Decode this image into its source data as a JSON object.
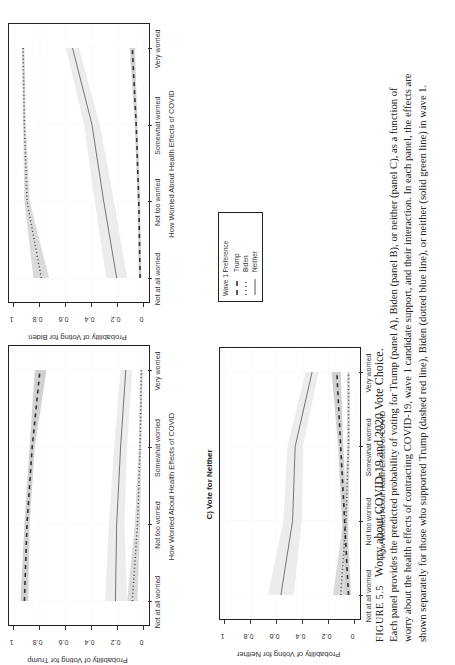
{
  "figure": {
    "label": "FIGURE 5.5",
    "title": "Worry about COVID-19 and 2020 Vote Choice.",
    "caption_lines": [
      "Each panel provides the predicted probability of voting for Trump (panel A), Biden (panel B), or neither (panel C), as a function of",
      "worry about the health effects of contracting COVID-19, wave 1 candidate support, and their interaction. In each panel, the effects are",
      "shown separately for those who supported Trump (dashed red line), Biden (dotted blue line), or neither (solid green line) in wave 1."
    ]
  },
  "legend": {
    "title": "Wave 1 Preference",
    "items": [
      {
        "label": "Trump",
        "style": "dashed"
      },
      {
        "label": "Biden",
        "style": "dotted"
      },
      {
        "label": "Neither",
        "style": "solid"
      }
    ]
  },
  "axes": {
    "xlabel": "How Worried About Health Effects of COVID",
    "categories": [
      "Not at all worried",
      "Not too worried",
      "Somewhat worried",
      "Very worried"
    ],
    "yticks": [
      "0",
      "0.2",
      "0.4",
      "0.6",
      "0.8",
      "1"
    ]
  },
  "panels": {
    "A": {
      "title": "",
      "ylabel": "Probability of Voting for Trump"
    },
    "B": {
      "title": "",
      "ylabel": "Probability of Voting for Biden"
    },
    "C": {
      "title": "C) Vote for Neither",
      "ylabel": "Probability of Voting for Neither"
    }
  },
  "chart_data": [
    {
      "type": "line",
      "title": "A) Vote for Trump",
      "xlabel": "How Worried About Health Effects of COVID",
      "ylabel": "Probability of Voting for Trump",
      "ylim": [
        0,
        1
      ],
      "categories": [
        "Not at all worried",
        "Not too worried",
        "Somewhat worried",
        "Very worried"
      ],
      "series": [
        {
          "name": "Trump",
          "style": "dashed",
          "values": [
            0.92,
            0.9,
            0.86,
            0.8
          ],
          "ci_lower": [
            0.89,
            0.88,
            0.84,
            0.75
          ],
          "ci_upper": [
            0.95,
            0.92,
            0.88,
            0.84
          ]
        },
        {
          "name": "Biden",
          "style": "dotted",
          "values": [
            0.09,
            0.05,
            0.03,
            0.02
          ],
          "ci_lower": [
            0.05,
            0.03,
            0.02,
            0.01
          ],
          "ci_upper": [
            0.13,
            0.07,
            0.04,
            0.03
          ]
        },
        {
          "name": "Neither",
          "style": "solid",
          "values": [
            0.22,
            0.21,
            0.18,
            0.14
          ],
          "ci_lower": [
            0.13,
            0.15,
            0.13,
            0.09
          ],
          "ci_upper": [
            0.3,
            0.27,
            0.23,
            0.18
          ]
        }
      ],
      "grid": true,
      "legend_position": "shared-box"
    },
    {
      "type": "line",
      "title": "B) Vote for Biden",
      "xlabel": "How Worried About Health Effects of COVID",
      "ylabel": "Probability of Voting for Biden",
      "ylim": [
        0,
        1
      ],
      "categories": [
        "Not at all worried",
        "Not too worried",
        "Somewhat worried",
        "Very worried"
      ],
      "series": [
        {
          "name": "Trump",
          "style": "dashed",
          "values": [
            0.03,
            0.04,
            0.06,
            0.09
          ],
          "ci_lower": [
            0.02,
            0.03,
            0.05,
            0.07
          ],
          "ci_upper": [
            0.04,
            0.05,
            0.07,
            0.11
          ]
        },
        {
          "name": "Biden",
          "style": "dotted",
          "values": [
            0.79,
            0.9,
            0.92,
            0.93
          ],
          "ci_lower": [
            0.73,
            0.88,
            0.91,
            0.92
          ],
          "ci_upper": [
            0.85,
            0.92,
            0.93,
            0.94
          ]
        },
        {
          "name": "Neither",
          "style": "solid",
          "values": [
            0.21,
            0.31,
            0.4,
            0.55
          ],
          "ci_lower": [
            0.13,
            0.23,
            0.34,
            0.5
          ],
          "ci_upper": [
            0.29,
            0.38,
            0.46,
            0.6
          ]
        }
      ],
      "grid": true,
      "legend_position": "shared-box"
    },
    {
      "type": "line",
      "title": "C) Vote for Neither",
      "xlabel": "How Worried About Health Effects of COVID",
      "ylabel": "Probability of Voting for Neither",
      "ylim": [
        0,
        1
      ],
      "categories": [
        "Not at all worried",
        "Not too worried",
        "Somewhat worried",
        "Very worried"
      ],
      "series": [
        {
          "name": "Trump",
          "style": "dashed",
          "values": [
            0.05,
            0.08,
            0.11,
            0.14
          ],
          "ci_lower": [
            0.03,
            0.06,
            0.09,
            0.11
          ],
          "ci_upper": [
            0.07,
            0.1,
            0.13,
            0.18
          ]
        },
        {
          "name": "Biden",
          "style": "dotted",
          "values": [
            0.11,
            0.07,
            0.05,
            0.05
          ],
          "ci_lower": [
            0.06,
            0.05,
            0.04,
            0.04
          ],
          "ci_upper": [
            0.17,
            0.09,
            0.06,
            0.06
          ]
        },
        {
          "name": "Neither",
          "style": "solid",
          "values": [
            0.57,
            0.48,
            0.46,
            0.33
          ],
          "ci_lower": [
            0.47,
            0.41,
            0.4,
            0.28
          ],
          "ci_upper": [
            0.67,
            0.55,
            0.52,
            0.38
          ]
        }
      ],
      "grid": true,
      "legend_position": "shared-box"
    }
  ]
}
